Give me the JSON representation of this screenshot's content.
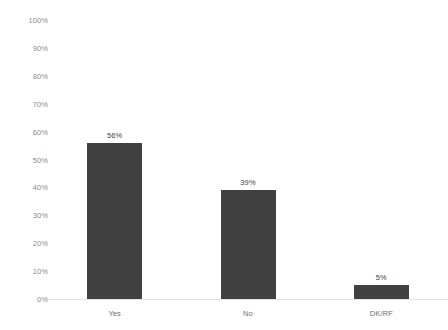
{
  "chart_data": {
    "type": "bar",
    "title": "",
    "subtitle": "",
    "xlabel": "",
    "ylabel": "",
    "categories": [
      "Yes",
      "No",
      "DK/RF"
    ],
    "values": [
      56,
      39,
      5
    ],
    "value_labels": [
      "56%",
      "39%",
      "5%"
    ],
    "ylim": [
      0,
      100
    ],
    "ytick_values": [
      0,
      10,
      20,
      30,
      40,
      50,
      60,
      70,
      80,
      90,
      100
    ],
    "ytick_labels": [
      "0%",
      "10%",
      "20%",
      "30%",
      "40%",
      "50%",
      "60%",
      "70%",
      "80%",
      "90%",
      "100%"
    ],
    "grid": false,
    "legend": false,
    "legend_position": "none",
    "annotations": [],
    "colors": {
      "bar": "#404040",
      "background": "#ffffff",
      "axis_line": "#e3e3e3",
      "ytick_label": "#8c8c8c",
      "category_label": "#6e6e6e",
      "value_label": "#3f3f3f"
    }
  }
}
